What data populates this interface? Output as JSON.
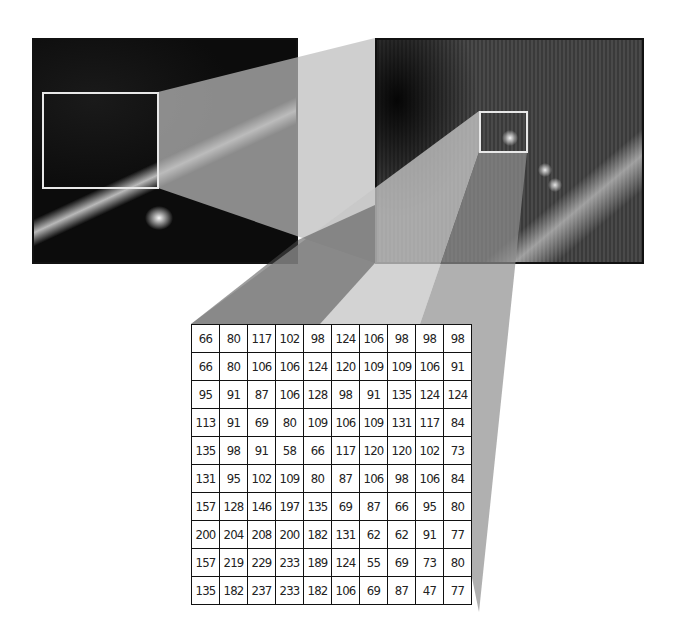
{
  "figure": {
    "left_image": {
      "label": "overview-aerial-image",
      "zoom_region": "white rectangle"
    },
    "right_image": {
      "label": "zoomed-aerial-image",
      "zoom_region": "white rectangle"
    },
    "colors": {
      "border": "#111111",
      "zoom_box": "#e8e8e8",
      "wedge_light": "#b4b4b4",
      "wedge_mid": "#8c8c8c",
      "wedge_dark": "#555555"
    }
  },
  "pixel_grid": {
    "rows": 10,
    "cols": 10,
    "values": [
      [
        66,
        80,
        117,
        102,
        98,
        124,
        106,
        98,
        98,
        98
      ],
      [
        66,
        80,
        106,
        106,
        124,
        120,
        109,
        109,
        106,
        91
      ],
      [
        95,
        91,
        87,
        106,
        128,
        98,
        91,
        135,
        124,
        124
      ],
      [
        113,
        91,
        69,
        80,
        109,
        106,
        109,
        131,
        117,
        84
      ],
      [
        135,
        98,
        91,
        58,
        66,
        117,
        120,
        120,
        102,
        73
      ],
      [
        131,
        95,
        102,
        109,
        80,
        87,
        106,
        98,
        106,
        84
      ],
      [
        157,
        128,
        146,
        197,
        135,
        69,
        87,
        66,
        95,
        80
      ],
      [
        200,
        204,
        208,
        200,
        182,
        131,
        62,
        62,
        91,
        77
      ],
      [
        157,
        219,
        229,
        233,
        189,
        124,
        55,
        69,
        73,
        80
      ],
      [
        135,
        182,
        237,
        233,
        182,
        106,
        69,
        87,
        47,
        77
      ]
    ]
  }
}
